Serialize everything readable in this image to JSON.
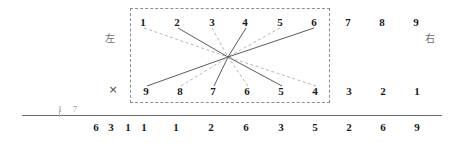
{
  "figure": {
    "title_characters": {
      "left_label": "左",
      "right_label": "右",
      "cross_mark": "×"
    },
    "box": {
      "style": "dashed",
      "x": 130,
      "y": 8,
      "width": 200,
      "height": 95,
      "color": "#8d8d8d"
    },
    "top_row_inner": [
      {
        "label": "1",
        "x": 143,
        "y": 22
      },
      {
        "label": "2",
        "x": 177,
        "y": 22
      },
      {
        "label": "3",
        "x": 212,
        "y": 22
      },
      {
        "label": "4",
        "x": 245,
        "y": 22
      },
      {
        "label": "5",
        "x": 280,
        "y": 22
      },
      {
        "label": "6",
        "x": 314,
        "y": 22
      }
    ],
    "top_row_outer": [
      {
        "label": "7",
        "x": 348,
        "y": 22
      },
      {
        "label": "8",
        "x": 382,
        "y": 22
      },
      {
        "label": "9",
        "x": 416,
        "y": 22
      }
    ],
    "bottom_row_inner": [
      {
        "label": "9",
        "x": 146,
        "y": 91
      },
      {
        "label": "8",
        "x": 180,
        "y": 91
      },
      {
        "label": "7",
        "x": 213,
        "y": 91
      },
      {
        "label": "6",
        "x": 247,
        "y": 91
      },
      {
        "label": "5",
        "x": 281,
        "y": 91
      },
      {
        "label": "4",
        "x": 315,
        "y": 91
      }
    ],
    "bottom_row_outer": [
      {
        "label": "3",
        "x": 349,
        "y": 91
      },
      {
        "label": "2",
        "x": 383,
        "y": 91
      },
      {
        "label": "1",
        "x": 417,
        "y": 91
      }
    ],
    "side_labels": [
      {
        "name": "left-cjk",
        "text": "左",
        "x": 110,
        "y": 39
      },
      {
        "name": "right-cjk",
        "text": "右",
        "x": 430,
        "y": 39
      },
      {
        "name": "cross",
        "text": "×",
        "x": 113,
        "y": 89
      }
    ],
    "hub": {
      "x": 228,
      "y": 57
    },
    "rays": [
      {
        "id": "top-1",
        "from_label": "1",
        "x": 144,
        "y": 28,
        "style": "dashed"
      },
      {
        "id": "top-2",
        "from_label": "2",
        "x": 178,
        "y": 28,
        "style": "solid"
      },
      {
        "id": "top-3",
        "from_label": "3",
        "x": 212,
        "y": 28,
        "style": "dashed"
      },
      {
        "id": "top-4",
        "from_label": "4",
        "x": 246,
        "y": 28,
        "style": "solid"
      },
      {
        "id": "top-5",
        "from_label": "5",
        "x": 280,
        "y": 28,
        "style": "dashed"
      },
      {
        "id": "top-6",
        "from_label": "6",
        "x": 314,
        "y": 28,
        "style": "solid"
      },
      {
        "id": "bottom-9",
        "from_label": "9",
        "x": 147,
        "y": 86,
        "style": "solid"
      },
      {
        "id": "bottom-8",
        "from_label": "8",
        "x": 181,
        "y": 86,
        "style": "dashed"
      },
      {
        "id": "bottom-7",
        "from_label": "7",
        "x": 214,
        "y": 86,
        "style": "solid"
      },
      {
        "id": "bottom-6",
        "from_label": "6",
        "x": 248,
        "y": 86,
        "style": "dashed"
      },
      {
        "id": "bottom-5",
        "from_label": "5",
        "x": 282,
        "y": 86,
        "style": "solid"
      },
      {
        "id": "bottom-4",
        "from_label": "4",
        "x": 316,
        "y": 86,
        "style": "dashed"
      }
    ],
    "baseline": {
      "x": 22,
      "y": 115,
      "width": 420,
      "color": "#6b6b6b"
    },
    "baseline_marks": {
      "tick_x": 59,
      "faint_left": {
        "label": "1",
        "x": 60,
        "y": 109
      },
      "faint_right": {
        "label": "7",
        "x": 75,
        "y": 109
      }
    },
    "bottom_scale": [
      {
        "label": "6",
        "x": 96,
        "y": 127
      },
      {
        "label": "3",
        "x": 111,
        "y": 127
      },
      {
        "label": "1",
        "x": 128,
        "y": 127
      },
      {
        "label": "1",
        "x": 144,
        "y": 127
      },
      {
        "label": "1",
        "x": 176,
        "y": 127
      },
      {
        "label": "2",
        "x": 211,
        "y": 127
      },
      {
        "label": "6",
        "x": 246,
        "y": 127
      },
      {
        "label": "3",
        "x": 281,
        "y": 127
      },
      {
        "label": "5",
        "x": 315,
        "y": 127
      },
      {
        "label": "2",
        "x": 349,
        "y": 127
      },
      {
        "label": "6",
        "x": 383,
        "y": 127
      },
      {
        "label": "9",
        "x": 417,
        "y": 127
      }
    ],
    "colors": {
      "ink": "#1a1a1a",
      "line_solid": "#5b5b5b",
      "line_dashed": "#a5a5a5",
      "box_border": "#8d8d8d",
      "baseline": "#6b6b6b",
      "faint": "#9a9a9a"
    }
  }
}
